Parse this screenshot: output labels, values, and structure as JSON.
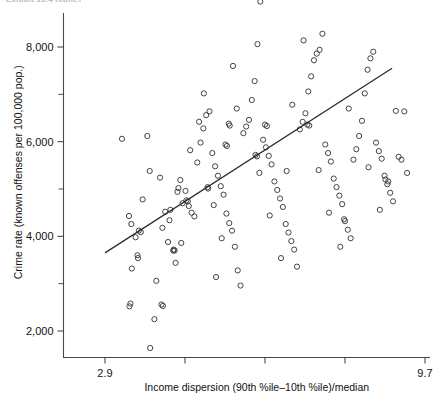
{
  "clipped_header": {
    "text": "Exhibit 10.4  (cont.)"
  },
  "chart_data": {
    "type": "scatter",
    "title": "",
    "xlabel": "Income dispersion (90th %ile–10th %ile)/median",
    "ylabel": "Crime rate (known offenses per 100,000 pop.)",
    "xlim": [
      2.9,
      9.7
    ],
    "ylim": [
      1350,
      9250
    ],
    "grid": false,
    "legend": null,
    "x_ticks": [
      {
        "value": 2.9,
        "label": "2.9"
      },
      {
        "value": 4.6,
        "label": ""
      },
      {
        "value": 6.3,
        "label": ""
      },
      {
        "value": 8.0,
        "label": ""
      },
      {
        "value": 9.7,
        "label": "9.7"
      }
    ],
    "y_ticks": [
      {
        "value": 2000,
        "label": "2,000"
      },
      {
        "value": 3000,
        "label": ""
      },
      {
        "value": 4000,
        "label": "4,000"
      },
      {
        "value": 5000,
        "label": ""
      },
      {
        "value": 6000,
        "label": "6,000"
      },
      {
        "value": 7000,
        "label": ""
      },
      {
        "value": 8000,
        "label": "8,000"
      }
    ],
    "marker": {
      "shape": "open-circle",
      "radius": 2.6,
      "color": "#3a3a3a"
    },
    "fit_line": {
      "label": "regression line",
      "color": "#2b2b2b",
      "x_start": 2.9,
      "y_start": 3650,
      "x_end": 9.0,
      "y_end": 7550
    },
    "points": [
      [
        3.26,
        6060
      ],
      [
        3.8,
        6120
      ],
      [
        3.85,
        5380
      ],
      [
        4.07,
        5240
      ],
      [
        3.7,
        4780
      ],
      [
        3.41,
        4430
      ],
      [
        3.46,
        4260
      ],
      [
        3.62,
        4120
      ],
      [
        3.66,
        4090
      ],
      [
        3.55,
        3980
      ],
      [
        3.59,
        3600
      ],
      [
        3.6,
        3540
      ],
      [
        3.47,
        3320
      ],
      [
        3.44,
        2580
      ],
      [
        3.42,
        2520
      ],
      [
        3.95,
        2250
      ],
      [
        3.86,
        1640
      ],
      [
        3.99,
        3060
      ],
      [
        4.18,
        4520
      ],
      [
        4.29,
        4560
      ],
      [
        4.12,
        4180
      ],
      [
        4.24,
        3880
      ],
      [
        4.35,
        3700
      ],
      [
        4.4,
        3440
      ],
      [
        4.52,
        3860
      ],
      [
        4.46,
        5020
      ],
      [
        4.5,
        5190
      ],
      [
        4.61,
        4960
      ],
      [
        4.55,
        4700
      ],
      [
        4.68,
        4640
      ],
      [
        4.74,
        4500
      ],
      [
        4.8,
        4420
      ],
      [
        4.86,
        5560
      ],
      [
        4.71,
        5820
      ],
      [
        4.93,
        5980
      ],
      [
        4.99,
        6280
      ],
      [
        4.9,
        6420
      ],
      [
        5.05,
        6560
      ],
      [
        5.12,
        6640
      ],
      [
        5.0,
        7020
      ],
      [
        5.18,
        5760
      ],
      [
        5.24,
        5480
      ],
      [
        5.3,
        5280
      ],
      [
        5.36,
        5060
      ],
      [
        5.42,
        4880
      ],
      [
        5.21,
        4660
      ],
      [
        5.48,
        4480
      ],
      [
        5.54,
        4280
      ],
      [
        5.6,
        4120
      ],
      [
        5.38,
        3960
      ],
      [
        5.66,
        3780
      ],
      [
        5.72,
        3280
      ],
      [
        5.26,
        3140
      ],
      [
        5.78,
        2960
      ],
      [
        5.84,
        6180
      ],
      [
        5.9,
        6320
      ],
      [
        5.96,
        6460
      ],
      [
        5.7,
        6700
      ],
      [
        6.02,
        6880
      ],
      [
        6.08,
        7280
      ],
      [
        5.62,
        7600
      ],
      [
        6.14,
        8060
      ],
      [
        6.2,
        8960
      ],
      [
        6.26,
        6040
      ],
      [
        6.32,
        5880
      ],
      [
        6.38,
        5700
      ],
      [
        6.44,
        5520
      ],
      [
        6.18,
        5340
      ],
      [
        6.5,
        5160
      ],
      [
        6.56,
        4980
      ],
      [
        6.62,
        4800
      ],
      [
        6.68,
        4620
      ],
      [
        6.4,
        4440
      ],
      [
        6.74,
        4260
      ],
      [
        6.8,
        4080
      ],
      [
        6.86,
        3900
      ],
      [
        6.92,
        3720
      ],
      [
        6.64,
        3540
      ],
      [
        6.98,
        3360
      ],
      [
        7.04,
        6260
      ],
      [
        7.1,
        6420
      ],
      [
        7.16,
        6600
      ],
      [
        6.88,
        6780
      ],
      [
        7.22,
        7060
      ],
      [
        7.28,
        7380
      ],
      [
        7.34,
        7720
      ],
      [
        7.4,
        7860
      ],
      [
        7.46,
        7940
      ],
      [
        7.12,
        8140
      ],
      [
        7.52,
        8280
      ],
      [
        7.58,
        5940
      ],
      [
        7.64,
        5760
      ],
      [
        7.7,
        5580
      ],
      [
        7.44,
        5400
      ],
      [
        7.76,
        5220
      ],
      [
        7.82,
        5040
      ],
      [
        7.88,
        4860
      ],
      [
        7.94,
        4680
      ],
      [
        7.66,
        4500
      ],
      [
        8.0,
        4320
      ],
      [
        8.06,
        4140
      ],
      [
        8.12,
        3960
      ],
      [
        7.9,
        3780
      ],
      [
        8.18,
        5620
      ],
      [
        8.24,
        5840
      ],
      [
        8.3,
        6120
      ],
      [
        8.36,
        6440
      ],
      [
        8.08,
        6700
      ],
      [
        8.42,
        7020
      ],
      [
        8.48,
        7520
      ],
      [
        8.54,
        7760
      ],
      [
        8.6,
        7900
      ],
      [
        8.66,
        5980
      ],
      [
        8.72,
        5800
      ],
      [
        8.78,
        5640
      ],
      [
        8.5,
        5460
      ],
      [
        8.84,
        5280
      ],
      [
        8.9,
        5100
      ],
      [
        8.96,
        4920
      ],
      [
        9.02,
        4740
      ],
      [
        8.74,
        4560
      ],
      [
        9.08,
        6650
      ],
      [
        9.14,
        5680
      ],
      [
        9.2,
        5620
      ],
      [
        9.26,
        6640
      ],
      [
        9.32,
        5340
      ],
      [
        4.63,
        4760
      ],
      [
        4.66,
        4740
      ],
      [
        5.08,
        5040
      ],
      [
        5.09,
        5010
      ],
      [
        4.36,
        3720
      ],
      [
        4.38,
        3700
      ],
      [
        4.27,
        4340
      ],
      [
        5.53,
        6380
      ],
      [
        5.55,
        6340
      ],
      [
        6.3,
        6360
      ],
      [
        6.34,
        6330
      ],
      [
        7.2,
        6360
      ],
      [
        7.24,
        6340
      ],
      [
        4.1,
        2560
      ],
      [
        4.13,
        2530
      ],
      [
        8.86,
        5200
      ],
      [
        8.92,
        5160
      ],
      [
        6.1,
        5720
      ],
      [
        6.13,
        5690
      ],
      [
        5.46,
        5940
      ],
      [
        5.49,
        5910
      ],
      [
        4.44,
        4940
      ],
      [
        6.76,
        5380
      ],
      [
        7.98,
        4360
      ]
    ]
  }
}
